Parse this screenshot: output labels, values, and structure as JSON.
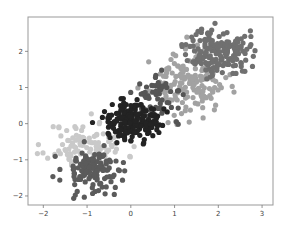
{
  "chart_data": {
    "type": "scatter",
    "title": "",
    "xlabel": "",
    "ylabel": "",
    "xlim": [
      -2.35,
      3.25
    ],
    "ylim": [
      -2.25,
      2.95
    ],
    "xticks": [
      -2,
      -1,
      0,
      1,
      2,
      3
    ],
    "yticks": [
      -2,
      -1,
      0,
      1,
      2
    ],
    "xtick_labels": [
      "−2",
      "−1",
      "0",
      "1",
      "2",
      "3"
    ],
    "ytick_labels": [
      "−2",
      "−1",
      "0",
      "1",
      "2"
    ],
    "grid": false,
    "legend": null,
    "marker_radius_px": 2.6,
    "series": [
      {
        "name": "cluster-very-light",
        "color": "#c9c9c9",
        "center": [
          -1.0,
          -0.6
        ],
        "spread": [
          0.45,
          0.32
        ],
        "count": 110,
        "seed": 11
      },
      {
        "name": "cluster-light-medium",
        "color": "#a2a2a2",
        "center": [
          1.3,
          1.1
        ],
        "spread": [
          0.42,
          0.42
        ],
        "count": 160,
        "seed": 23
      },
      {
        "name": "cluster-medium",
        "color": "#707070",
        "center": [
          2.0,
          2.0
        ],
        "spread": [
          0.35,
          0.32
        ],
        "count": 170,
        "seed": 37
      },
      {
        "name": "cluster-dark-medium",
        "color": "#555555",
        "center": [
          0.7,
          0.75
        ],
        "spread": [
          0.3,
          0.3
        ],
        "count": 60,
        "seed": 41
      },
      {
        "name": "cluster-dark-lower",
        "color": "#5b5b5b",
        "center": [
          -0.85,
          -1.3
        ],
        "spread": [
          0.35,
          0.32
        ],
        "count": 130,
        "seed": 53
      },
      {
        "name": "cluster-near-black",
        "color": "#232323",
        "center": [
          0.0,
          0.0
        ],
        "spread": [
          0.3,
          0.26
        ],
        "count": 180,
        "seed": 67
      }
    ]
  },
  "caption_fragment": "",
  "plot": {
    "frame_color": "#999999",
    "background": "#ffffff"
  }
}
